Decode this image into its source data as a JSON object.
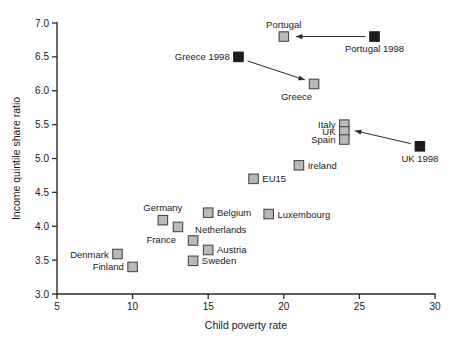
{
  "chart_data": {
    "type": "scatter",
    "title": "",
    "xlabel": "Child poverty rate",
    "ylabel": "Income quintile share ratio",
    "xlim": [
      5,
      30
    ],
    "ylim": [
      3.0,
      7.0
    ],
    "xticks": [
      "5",
      "10",
      "15",
      "20",
      "25",
      "30"
    ],
    "yticks": [
      "3.0",
      "3.5",
      "4.0",
      "4.5",
      "5.0",
      "5.5",
      "6.0",
      "6.5",
      "7.0"
    ],
    "grid": false,
    "legend": "none",
    "series": [
      {
        "name": "Current year",
        "marker": "light-square",
        "color": "#b9b9b9",
        "points": [
          {
            "label": "Portugal",
            "x": 20.0,
            "y": 6.8,
            "label_pos": "above"
          },
          {
            "label": "Greece",
            "x": 22.0,
            "y": 6.1,
            "label_pos": "below-left"
          },
          {
            "label": "Italy",
            "x": 24.0,
            "y": 5.5,
            "label_pos": "left"
          },
          {
            "label": "UK",
            "x": 24.0,
            "y": 5.4,
            "label_pos": "left"
          },
          {
            "label": "Spain",
            "x": 24.0,
            "y": 5.28,
            "label_pos": "left"
          },
          {
            "label": "Ireland",
            "x": 21.0,
            "y": 4.9,
            "label_pos": "right"
          },
          {
            "label": "EU15",
            "x": 18.0,
            "y": 4.7,
            "label_pos": "right"
          },
          {
            "label": "Belgium",
            "x": 15.0,
            "y": 4.2,
            "label_pos": "right"
          },
          {
            "label": "Luxembourg",
            "x": 19.0,
            "y": 4.18,
            "label_pos": "right"
          },
          {
            "label": "Germany",
            "x": 12.0,
            "y": 4.09,
            "label_pos": "above"
          },
          {
            "label": "France",
            "x": 13.0,
            "y": 3.99,
            "label_pos": "below-left"
          },
          {
            "label": "Netherlands",
            "x": 14.0,
            "y": 3.79,
            "label_pos": "above-right"
          },
          {
            "label": "Austria",
            "x": 15.0,
            "y": 3.65,
            "label_pos": "right"
          },
          {
            "label": "Denmark",
            "x": 9.0,
            "y": 3.59,
            "label_pos": "left"
          },
          {
            "label": "Sweden",
            "x": 14.0,
            "y": 3.49,
            "label_pos": "right"
          },
          {
            "label": "Finland",
            "x": 10.0,
            "y": 3.4,
            "label_pos": "left"
          }
        ]
      },
      {
        "name": "1998",
        "marker": "dark-square",
        "color": "#1c1c1c",
        "points": [
          {
            "label": "Portugal 1998",
            "x": 26.0,
            "y": 6.8,
            "label_pos": "below"
          },
          {
            "label": "Greece 1998",
            "x": 17.0,
            "y": 6.5,
            "label_pos": "left"
          },
          {
            "label": "UK 1998",
            "x": 29.0,
            "y": 5.18,
            "label_pos": "below"
          }
        ]
      }
    ],
    "annotations": [
      {
        "name": "portugal-arrow",
        "from_x": 25.4,
        "from_y": 6.8,
        "to_x": 20.8,
        "to_y": 6.8
      },
      {
        "name": "greece-arrow",
        "from_x": 17.6,
        "from_y": 6.44,
        "to_x": 21.4,
        "to_y": 6.16
      },
      {
        "name": "uk-arrow",
        "from_x": 28.4,
        "from_y": 5.22,
        "to_x": 24.7,
        "to_y": 5.41
      }
    ]
  }
}
